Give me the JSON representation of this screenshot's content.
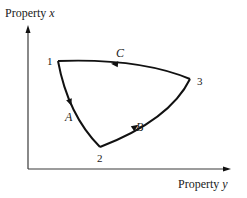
{
  "diagram": {
    "type": "process-cycle",
    "axes": {
      "vertical_label_prefix": "Property ",
      "vertical_label_var": "x",
      "horizontal_label_prefix": "Property ",
      "horizontal_label_var": "y"
    },
    "states": [
      {
        "id": "1",
        "label": "1"
      },
      {
        "id": "2",
        "label": "2"
      },
      {
        "id": "3",
        "label": "3"
      }
    ],
    "processes": [
      {
        "id": "A",
        "label": "A",
        "from": "1",
        "to": "2"
      },
      {
        "id": "B",
        "label": "B",
        "from": "2",
        "to": "3"
      },
      {
        "id": "C",
        "label": "C",
        "from": "3",
        "to": "1"
      }
    ],
    "colors": {
      "curve": "#111111",
      "axis": "#3a3a3a",
      "text": "#1a1a1a"
    }
  }
}
